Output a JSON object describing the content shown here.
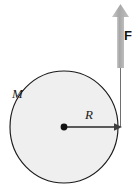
{
  "figure": {
    "kind": "physics-free-body-diagram",
    "background_color": "#ffffff"
  },
  "disk": {
    "name": "disk",
    "mass_label": "M",
    "radius_label": "R",
    "fill_color": "#efefef",
    "stroke_color": "#1a1a1a",
    "center_x": 64,
    "center_y": 127,
    "radius_x": 54,
    "radius_y": 56
  },
  "center_point": {
    "name": "center-dot",
    "color": "#111111",
    "x": 64,
    "y": 127,
    "size": 6
  },
  "radius_arrow": {
    "name": "radius-arrow",
    "label": "R",
    "color": "#555555",
    "from_x": 64,
    "from_y": 127,
    "to_x": 121,
    "to_y": 127
  },
  "force_arrow": {
    "name": "force-arrow",
    "label": "F",
    "color": "#a6a6a6",
    "tail_x": 120,
    "tail_y": 127,
    "tip_x": 120,
    "tip_y": 5,
    "direction": "up"
  },
  "caption": {
    "text": ""
  },
  "colors": {
    "disk_fill": "#efefef",
    "disk_stroke": "#1a1a1a",
    "arrow_gray": "#a6a6a6",
    "radius_gray": "#555555",
    "text": "#1a1a1a"
  }
}
